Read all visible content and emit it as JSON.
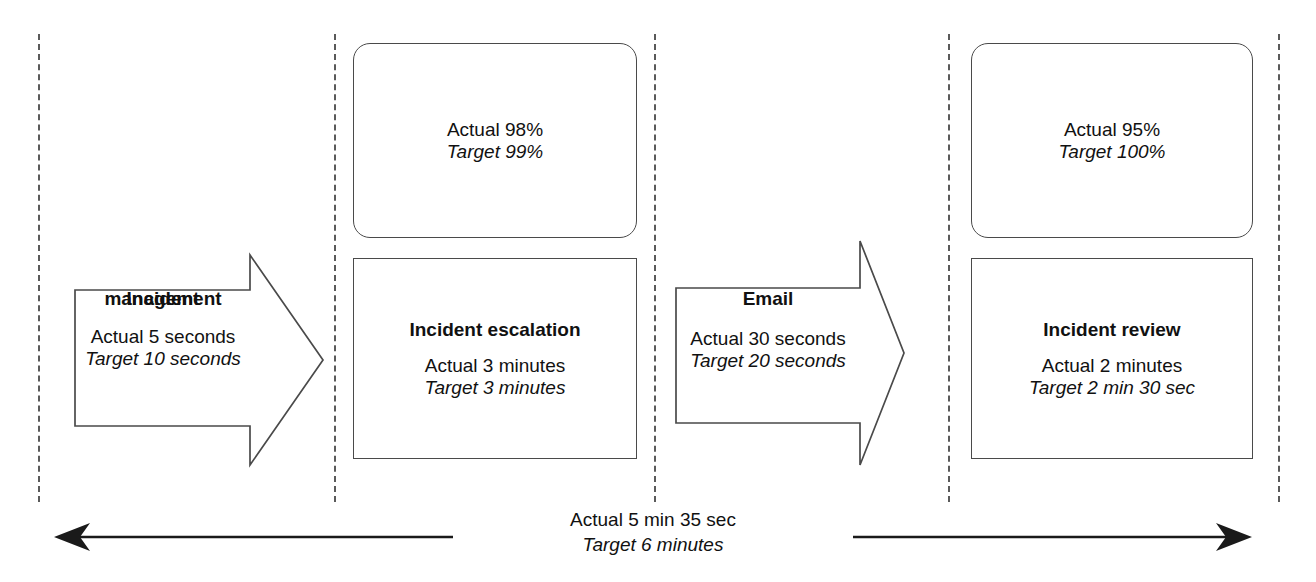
{
  "diagram": {
    "lane_separator_count": 5,
    "colors": {
      "shape_stroke": "#4a4a4a",
      "lane_dash": "#5a5a5a",
      "text": "#111111",
      "timeline_stroke": "#1a1a1a",
      "background": "#ffffff"
    }
  },
  "kpi_boxes": [
    {
      "id": "incident-escalation-kpi",
      "actual": "Actual 98%",
      "target": "Target 99%"
    },
    {
      "id": "incident-review-kpi",
      "actual": "Actual 95%",
      "target": "Target 100%"
    }
  ],
  "process_boxes": [
    {
      "id": "incident-escalation",
      "title": "Incident escalation",
      "actual": "Actual 3 minutes",
      "target": "Target 3 minutes"
    },
    {
      "id": "incident-review",
      "title": "Incident review",
      "actual": "Actual 2 minutes",
      "target": "Target 2 min 30 sec"
    }
  ],
  "arrows": [
    {
      "id": "incident-management",
      "title_line1": "Incident",
      "title_line2": "management",
      "actual": "Actual 5 seconds",
      "target": "Target 10 seconds"
    },
    {
      "id": "email",
      "title_line1": "Email",
      "title_line2": "",
      "actual": "Actual 30 seconds",
      "target": "Target 20 seconds"
    }
  ],
  "timeline": {
    "actual": "Actual 5 min 35 sec",
    "target": "Target 6 minutes",
    "direction": "double-headed"
  }
}
